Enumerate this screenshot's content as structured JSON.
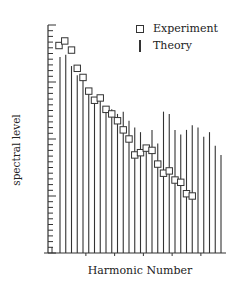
{
  "chart_data": {
    "type": "bar",
    "subtype": "stem-with-markers",
    "title": "",
    "xlabel": "Harmonic Number",
    "ylabel": "spectral level",
    "x_tick_labels": [],
    "y_tick_labels": [],
    "grid": false,
    "legend_position": "top-right",
    "ylim": [
      0,
      100
    ],
    "harmonics": [
      1,
      2,
      3,
      4,
      5,
      6,
      7,
      8,
      9,
      10,
      11,
      12,
      13,
      14,
      15,
      16,
      17,
      18,
      19,
      20,
      21,
      22,
      23,
      24,
      25,
      26,
      27,
      28,
      29
    ],
    "series": [
      {
        "name": "Theory",
        "marker": "vertical-line",
        "values": [
          86,
          87,
          82,
          78,
          76,
          71,
          68,
          67,
          63,
          63,
          61,
          62,
          58,
          55,
          53,
          46,
          54,
          48,
          62,
          61,
          54,
          52,
          54,
          56,
          55,
          51,
          53,
          47,
          43
        ]
      },
      {
        "name": "Experiment",
        "marker": "square",
        "values": [
          91,
          93,
          89,
          81,
          77,
          71,
          67,
          68,
          63,
          61,
          58,
          54,
          50,
          43,
          44,
          46,
          45,
          39,
          35,
          36,
          32,
          31,
          26,
          25,
          null,
          null,
          null,
          null,
          null
        ]
      }
    ]
  },
  "legend": {
    "items": [
      {
        "label": "Experiment",
        "symbol": "square-icon"
      },
      {
        "label": "Theory",
        "symbol": "vertical-line-icon"
      }
    ]
  },
  "axes": {
    "x_label": "Harmonic Number",
    "y_label": "spectral level"
  },
  "colors": {
    "ink": "#333333",
    "background": "#ffffff"
  }
}
